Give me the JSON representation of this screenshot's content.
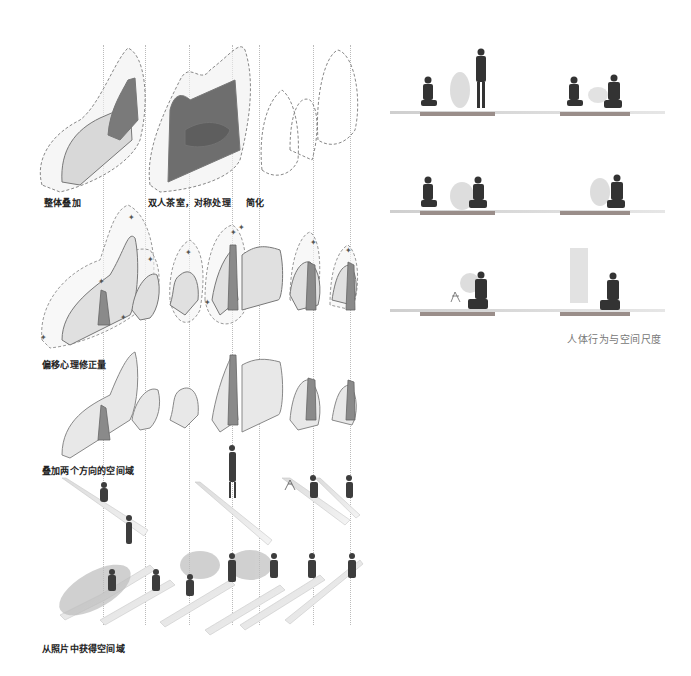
{
  "left_panel": {
    "row1": {
      "labels": [
        "整体叠加",
        "双人茶室，对称处理",
        "简化"
      ]
    },
    "row2": {
      "label": "偏移心理修正量"
    },
    "row3": {
      "label": "叠加两个方向的空间域"
    },
    "row4": {
      "label": "从照片中获得空间域"
    }
  },
  "right_panel": {
    "caption": "人体行为与空间尺度",
    "rows": [
      {
        "name": "row-1",
        "scenes": [
          "kneeling person and standing person",
          "two seated persons facing"
        ]
      },
      {
        "name": "row-2",
        "scenes": [
          "kneeling person and bowing person",
          "bowing person"
        ]
      },
      {
        "name": "row-3",
        "scenes": [
          "person with small stand",
          "persons overlapping motion"
        ]
      }
    ]
  },
  "colors": {
    "line": "#888888",
    "dashed": "#999999",
    "fill_light": "#e6e6e6",
    "fill_dark": "#8a8a8a",
    "text": "#222222",
    "caption": "#777777",
    "mat": "#9a8e8a"
  }
}
